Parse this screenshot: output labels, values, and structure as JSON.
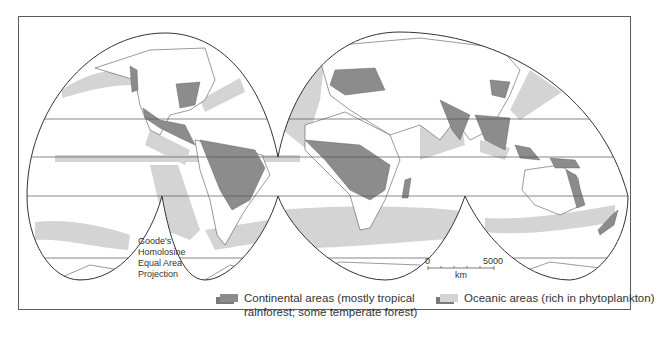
{
  "figure": {
    "projection_label": [
      "Goode's",
      "Homolosine",
      "Equal Area",
      "Projection"
    ],
    "scale": {
      "start": "0",
      "end": "5000",
      "unit": "km"
    },
    "legend": [
      {
        "label_line1": "Continental areas (mostly tropical",
        "label_line2": "rainforest; some temperate forest)",
        "color": "#8c8c8c"
      },
      {
        "label_line1": "Oceanic areas (rich in phytoplankton)",
        "label_line2": "",
        "color": "#d4d4d4"
      }
    ],
    "colors": {
      "continental": "#8c8c8c",
      "oceanic": "#d4d4d4",
      "land": "#ffffff",
      "outline": "#444444"
    }
  }
}
